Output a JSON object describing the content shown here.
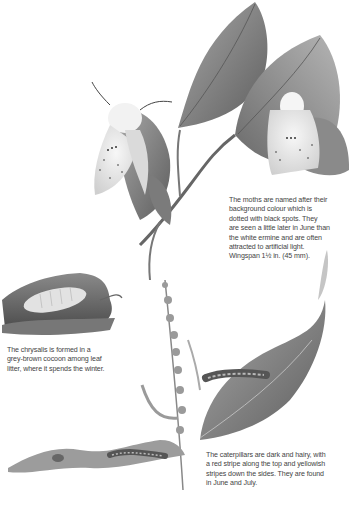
{
  "page": {
    "type": "illustrated natural history page (white/buff ermine moth life cycle)"
  },
  "illustrations": [
    {
      "name": "moths-on-beech-twig",
      "description": "Two pale moths resting on a beech twig with leaves"
    },
    {
      "name": "chrysalis-in-cocoon",
      "description": "Chrysalis in grey-brown cocoon among leaf litter"
    },
    {
      "name": "caterpillars-on-plants",
      "description": "Hairy caterpillars on dock leaves and flowering stem"
    }
  ],
  "captions": {
    "moths": {
      "lines": [
        "The moths are named after their",
        "background colour which is",
        "dotted with black spots. They",
        "are seen a little later in June than",
        "the white ermine and are often",
        "attracted to artificial light.",
        "Wingspan 1½ in. (45 mm)."
      ]
    },
    "chrysalis": {
      "lines": [
        "The chrysalis is formed in a",
        "grey-brown cocoon among leaf",
        "litter, where it spends the winter."
      ]
    },
    "caterpillars": {
      "lines": [
        "The caterpillars are dark and hairy, with",
        "a red stripe along the top and yellowish",
        "stripes down the sides. They are found",
        "in June and July."
      ]
    }
  },
  "colors": {
    "background": "#ffffff",
    "text": "#444444",
    "leaf_dark": "#6e6e6e",
    "leaf_mid": "#9a9a9a",
    "moth_wing": "#ececec"
  }
}
